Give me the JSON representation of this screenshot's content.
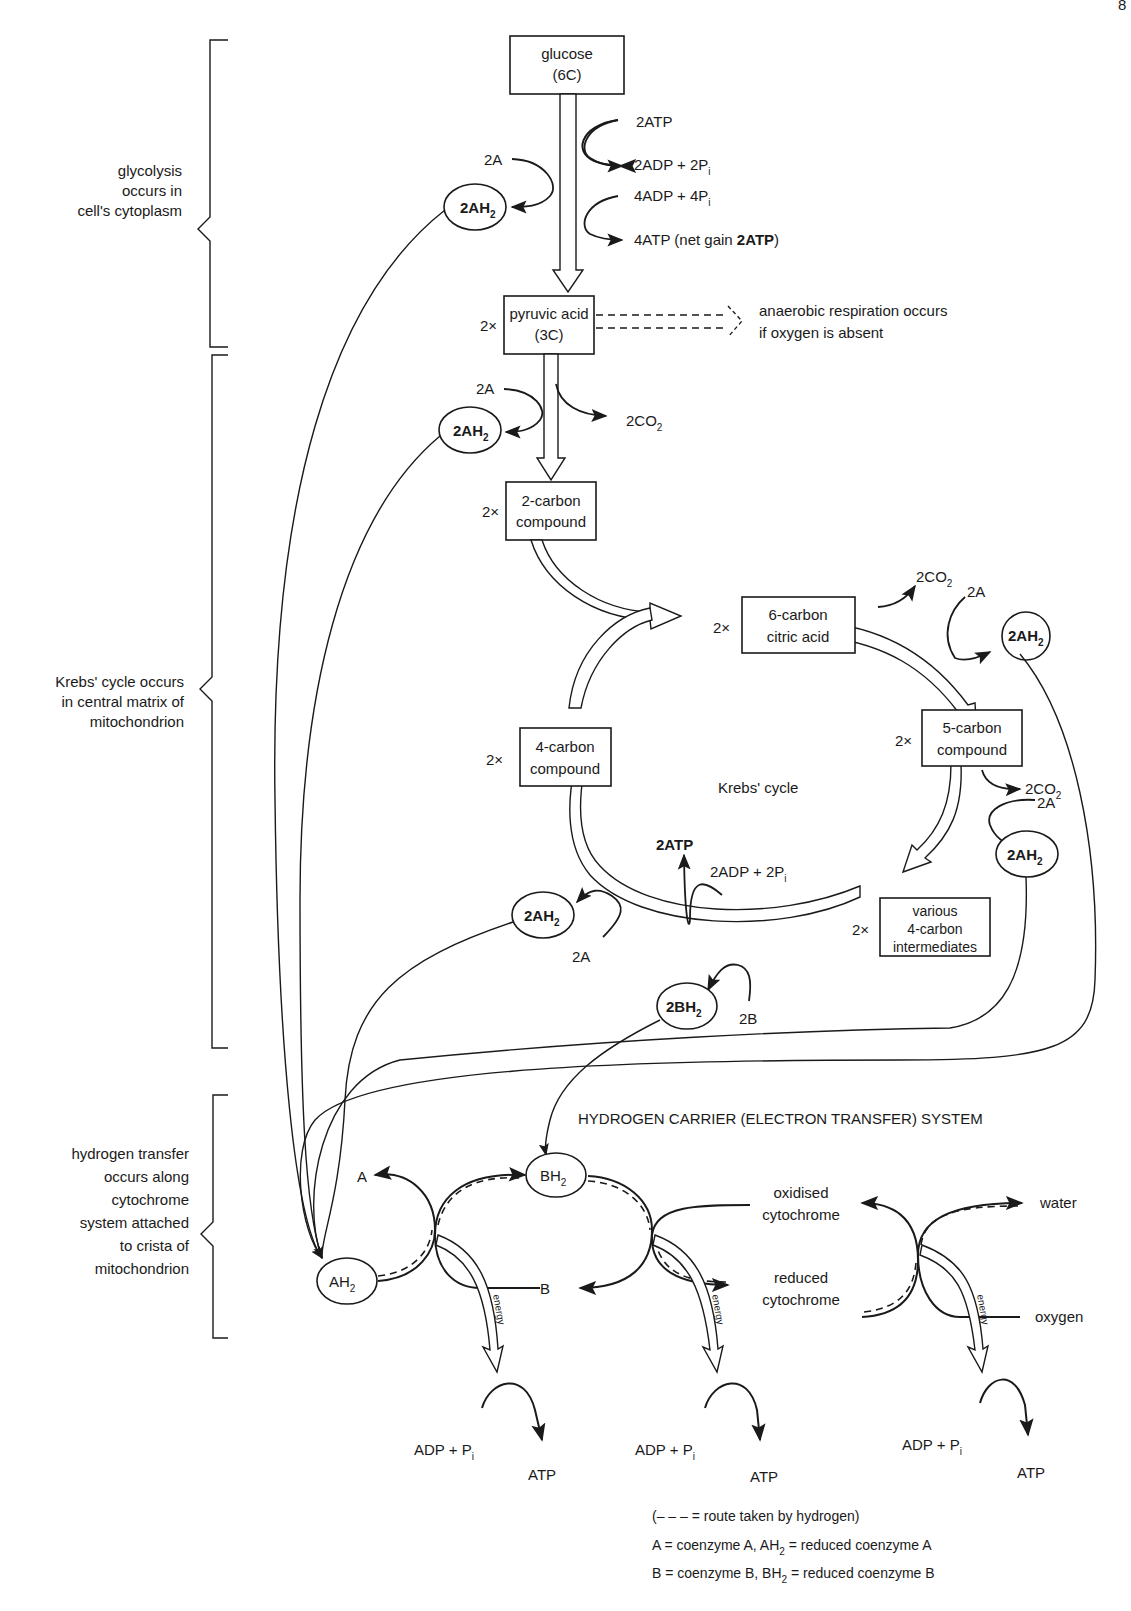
{
  "page": {
    "number_fragment": "8"
  },
  "side_labels": {
    "glycolysis": "glycolysis occurs in cell's cytoplasm",
    "glycolysis_lines": [
      "glycolysis",
      "occurs in",
      "cell's cytoplasm"
    ],
    "krebs_lines": [
      "Krebs' cycle occurs",
      "in central matrix of",
      "mitochondrion"
    ],
    "hydrogen_lines": [
      "hydrogen transfer",
      "occurs along",
      "cytochrome",
      "system attached",
      "to crista of",
      "mitochondrion"
    ]
  },
  "glycolysis": {
    "glucose_box": [
      "glucose",
      "(6C)"
    ],
    "in_2atp": "2ATP",
    "out_2adp": "2ADP + 2P",
    "in_4adp": "4ADP + 4P",
    "out_4atp": "4ATP (net gain ",
    "out_4atp_bold": "2ATP",
    "out_4atp_close": ")",
    "in_2a": "2A",
    "out_2ah2": "2AH",
    "subscript_i": "i",
    "subscript_2": "2"
  },
  "pyruvate": {
    "multiplier": "2×",
    "box": [
      "pyruvic acid",
      "(3C)"
    ],
    "anaerobic_note": [
      "anaerobic respiration occurs",
      "if oxygen is absent"
    ],
    "in_2a": "2A",
    "out_2ah2": "2AH",
    "out_2co2": "2CO"
  },
  "two_carbon": {
    "multiplier": "2×",
    "box": [
      "2-carbon",
      "compound"
    ]
  },
  "krebs_cycle": {
    "title": "Krebs' cycle",
    "six_carbon": {
      "multiplier": "2×",
      "box": [
        "6-carbon",
        "citric acid"
      ]
    },
    "five_carbon": {
      "multiplier": "2×",
      "box": [
        "5-carbon",
        "compound"
      ]
    },
    "four_carbon_intermediates": {
      "multiplier": "2×",
      "box": [
        "various",
        "4-carbon",
        "intermediates"
      ]
    },
    "four_carbon": {
      "multiplier": "2×",
      "box": [
        "4-carbon",
        "compound"
      ]
    },
    "step1": {
      "out_2co2": "2CO",
      "in_2a": "2A",
      "out_2ah2": "2AH"
    },
    "step2": {
      "out_2co2": "2CO",
      "in_2a": "2A",
      "out_2ah2": "2AH"
    },
    "atp_step": {
      "out_2atp": "2ATP",
      "in_2adp": "2ADP + 2P"
    },
    "step3": {
      "in_2a": "2A",
      "out_2ah2": "2AH"
    },
    "step4": {
      "in_2b": "2B",
      "out_2bh2": "2BH"
    }
  },
  "electron_transfer": {
    "title": "HYDROGEN CARRIER (ELECTRON TRANSFER) SYSTEM",
    "ah2": "AH",
    "bh2": "BH",
    "a_label": "A",
    "b_label": "B",
    "oxidised": [
      "oxidised",
      "cytochrome"
    ],
    "reduced": [
      "reduced",
      "cytochrome"
    ],
    "water": "water",
    "oxygen": "oxygen",
    "energy_label": "energy",
    "adp_pi": "ADP + P",
    "atp": "ATP"
  },
  "legend": {
    "dash_line": "(– – –  = route taken by hydrogen)",
    "a_def_1": "A = coenzyme A,  AH",
    "a_def_2": " = reduced coenzyme A",
    "b_def_1": "B = coenzyme B,  BH",
    "b_def_2": " = reduced coenzyme B"
  }
}
